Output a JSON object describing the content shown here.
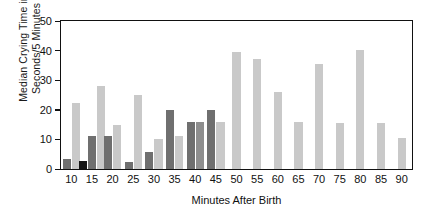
{
  "chart_data": {
    "type": "bar",
    "title": "",
    "xlabel": "Minutes After Birth",
    "ylabel": "Median Crying Time in\nSeconds/5 Minutes",
    "ylim": [
      0,
      50
    ],
    "yticks": [
      0,
      10,
      20,
      30,
      40,
      50
    ],
    "grid": false,
    "legend": "none",
    "categories": [
      "10",
      "15",
      "20",
      "25",
      "30",
      "35",
      "40",
      "45",
      "50",
      "55",
      "60",
      "65",
      "70",
      "75",
      "80",
      "85",
      "90"
    ],
    "series_colors": {
      "black": "#151515",
      "dark_gray": "#6f6f6f",
      "medium_gray": "#8e8e8e",
      "light_gray": "#c9c9c9",
      "pale_gray": "#d3d3d3"
    },
    "groups": [
      {
        "category": "10",
        "bars": [
          {
            "value": 3.5,
            "shade": "dark_gray"
          },
          {
            "value": 22.3,
            "shade": "light_gray"
          }
        ]
      },
      {
        "category": "15",
        "bars": [
          {
            "value": 2.8,
            "shade": "black"
          },
          {
            "value": 11.0,
            "shade": "dark_gray"
          },
          {
            "value": 28.0,
            "shade": "light_gray"
          }
        ]
      },
      {
        "category": "20",
        "bars": [
          {
            "value": 11.3,
            "shade": "dark_gray"
          },
          {
            "value": 15.0,
            "shade": "light_gray"
          }
        ]
      },
      {
        "category": "25",
        "bars": [
          {
            "value": 2.3,
            "shade": "dark_gray"
          },
          {
            "value": 25.0,
            "shade": "light_gray"
          }
        ]
      },
      {
        "category": "30",
        "bars": [
          {
            "value": 5.6,
            "shade": "dark_gray"
          },
          {
            "value": 10.0,
            "shade": "light_gray"
          }
        ]
      },
      {
        "category": "35",
        "bars": [
          {
            "value": 20.0,
            "shade": "dark_gray"
          },
          {
            "value": 11.0,
            "shade": "light_gray"
          }
        ]
      },
      {
        "category": "40",
        "bars": [
          {
            "value": 16.0,
            "shade": "dark_gray"
          },
          {
            "value": 16.0,
            "shade": "medium_gray"
          }
        ]
      },
      {
        "category": "45",
        "bars": [
          {
            "value": 20.0,
            "shade": "dark_gray"
          },
          {
            "value": 16.0,
            "shade": "light_gray"
          }
        ]
      },
      {
        "category": "50",
        "bars": [
          {
            "value": 39.5,
            "shade": "light_gray"
          }
        ]
      },
      {
        "category": "55",
        "bars": [
          {
            "value": 37.0,
            "shade": "light_gray"
          }
        ]
      },
      {
        "category": "60",
        "bars": [
          {
            "value": 26.0,
            "shade": "light_gray"
          }
        ]
      },
      {
        "category": "65",
        "bars": [
          {
            "value": 16.0,
            "shade": "light_gray"
          }
        ]
      },
      {
        "category": "70",
        "bars": [
          {
            "value": 35.5,
            "shade": "light_gray"
          }
        ]
      },
      {
        "category": "75",
        "bars": [
          {
            "value": 15.5,
            "shade": "light_gray"
          }
        ]
      },
      {
        "category": "80",
        "bars": [
          {
            "value": 40.3,
            "shade": "light_gray"
          }
        ]
      },
      {
        "category": "85",
        "bars": [
          {
            "value": 15.5,
            "shade": "light_gray"
          }
        ]
      },
      {
        "category": "90",
        "bars": [
          {
            "value": 10.5,
            "shade": "light_gray"
          }
        ]
      }
    ]
  }
}
